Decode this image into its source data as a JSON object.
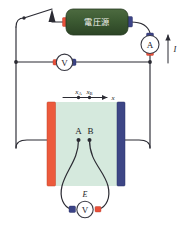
{
  "figure": {
    "background_color": "#ffffff",
    "width": 182,
    "height": 232
  },
  "colors": {
    "wire": "#2b2b33",
    "source_body": "#3c5a32",
    "terminal_positive": "#e8503a",
    "terminal_negative": "#3b4386",
    "electrode_left": "#ec5a3c",
    "electrode_right": "#3d4686",
    "electrolyte": "#d5e9dd",
    "meter_face": "#ffffff"
  },
  "source": {
    "label": "電圧源",
    "terminal_left_color": "#e8503a",
    "terminal_right_color": "#3b4386"
  },
  "meters": {
    "ammeter": {
      "label": "A",
      "name": "ammeter"
    },
    "voltmeter_main": {
      "label": "V",
      "name": "main-voltmeter"
    },
    "voltmeter_probe": {
      "label": "V",
      "name": "probe-voltmeter"
    }
  },
  "annotations": {
    "current_label": "I",
    "emf_label": "E",
    "axis_label": "x",
    "position_a": "x",
    "position_a_sub": "A",
    "position_b": "x",
    "position_b_sub": "B",
    "probe_a": "A",
    "probe_b": "B"
  },
  "components": {
    "switch_name": "knife-switch",
    "electrode_left_name": "anode-electrode",
    "electrode_right_name": "cathode-electrode",
    "cell_name": "electrolyte-cell"
  }
}
